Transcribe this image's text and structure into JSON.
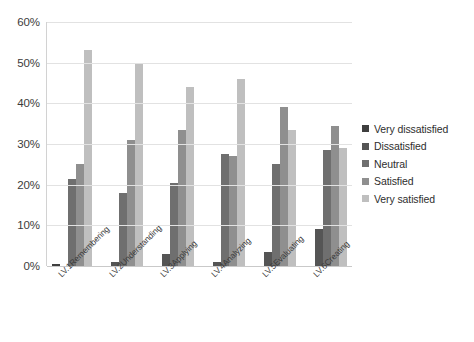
{
  "chart_data": {
    "type": "bar",
    "title": "",
    "xlabel": "",
    "ylabel": "",
    "grid": true,
    "legend_position": "right",
    "ylim": [
      0,
      60
    ],
    "ytick_labels": [
      "60%",
      "50%",
      "40%",
      "30%",
      "20%",
      "10%",
      "0%"
    ],
    "ytick_values": [
      60,
      50,
      40,
      30,
      20,
      10,
      0
    ],
    "categories": [
      "LV.1Remembering",
      "LV.2Understanding",
      "LV.3Applying",
      "LV.4Analyzing",
      "LV.5Evaluating",
      "LV.6Creating"
    ],
    "series": [
      {
        "name": "Very dissatisfied",
        "color": "#3f3f3f",
        "values": [
          0.5,
          0.0,
          0.0,
          0.0,
          0.0,
          0.0
        ]
      },
      {
        "name": "Dissatisfied",
        "color": "#555555",
        "values": [
          0.0,
          1.0,
          3.0,
          1.0,
          3.5,
          9.0
        ]
      },
      {
        "name": "Neutral",
        "color": "#6f6f6f",
        "values": [
          21.5,
          18.0,
          20.5,
          27.5,
          25.0,
          28.5
        ]
      },
      {
        "name": "Satisfied",
        "color": "#8f8f8f",
        "values": [
          25.0,
          31.0,
          33.5,
          27.0,
          39.0,
          34.5
        ]
      },
      {
        "name": "Very satisfied",
        "color": "#bfbfbf",
        "values": [
          53.0,
          50.0,
          44.0,
          46.0,
          33.5,
          29.0
        ]
      }
    ]
  }
}
